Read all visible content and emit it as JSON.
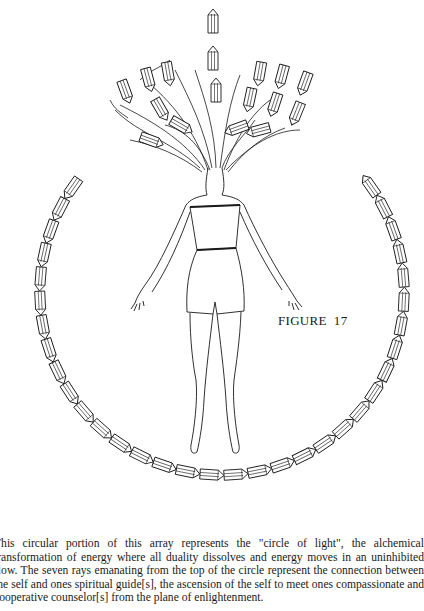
{
  "page": {
    "figure": {
      "label": "FIGURE  17",
      "description": "Line drawing of a woman in a strapless romper, arms outstretched, hair flowing upward mixed with quartz crystals, surrounded by a circle of crystal points; a vertical ray of crystals rises from the top of the head.",
      "elements": {
        "circle_crystal_count": 34,
        "ray_crystal_count": 3,
        "hair_cluster_crystals": 14
      },
      "line_color": "#1a1a1a",
      "background": "#ffffff"
    },
    "caption": {
      "text": "This circular portion of this array represents the \"circle of light\", the alchemical transformation of energy where all duality dissolves and energy moves in an uninhibited flow.  The seven rays emanating from the top of the circle represent the connection between the self and ones spiritual guide[s], the ascension of the self to meet ones compassionate and cooperative counselor[s] from the plane of enlightenment."
    }
  }
}
